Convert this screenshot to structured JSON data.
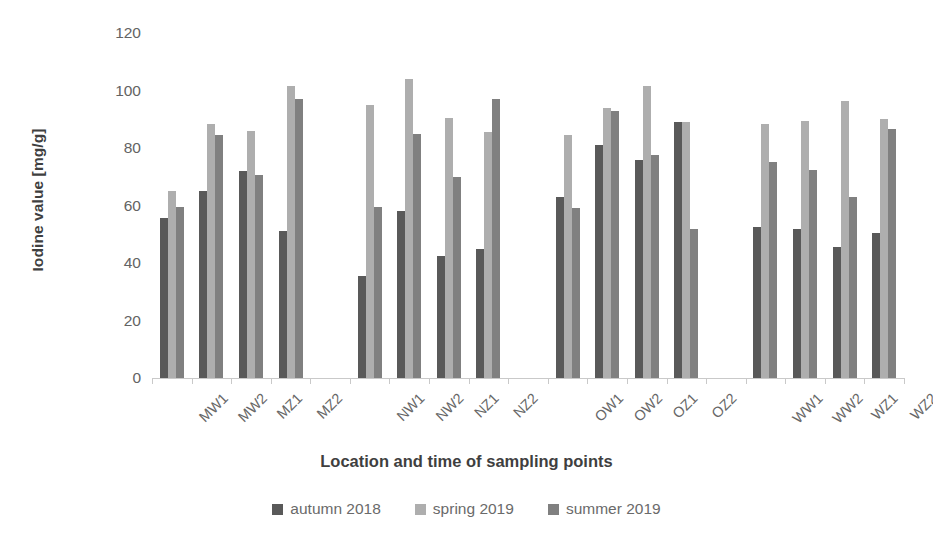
{
  "chart_data": {
    "type": "bar",
    "title": "",
    "xlabel": "Location and time of sampling points",
    "ylabel": "Iodine value [mg/g]",
    "ylim": [
      0,
      120
    ],
    "yticks": [
      0,
      20,
      40,
      60,
      80,
      100,
      120
    ],
    "grid": false,
    "legend_position": "bottom",
    "categories": [
      "MW1",
      "MW2",
      "MZ1",
      "MZ2",
      "NW1",
      "NW2",
      "NZ1",
      "NZ2",
      "OW1",
      "OW2",
      "OZ1",
      "OZ2",
      "WW1",
      "WW2",
      "WZ1",
      "WZ2"
    ],
    "group_breaks_after": [
      "MZ2",
      "NZ2",
      "OZ2"
    ],
    "series": [
      {
        "name": "autumn 2018",
        "color": "#595959",
        "values": [
          55.5,
          65.0,
          72.0,
          51.0,
          35.5,
          58.0,
          42.5,
          45.0,
          63.0,
          81.0,
          76.0,
          89.0,
          52.5,
          52.0,
          45.5,
          50.5
        ]
      },
      {
        "name": "spring 2019",
        "color": "#aeaeae",
        "values": [
          65.0,
          88.5,
          86.0,
          101.5,
          95.0,
          104.0,
          90.5,
          85.5,
          84.5,
          94.0,
          101.5,
          89.0,
          88.5,
          89.5,
          96.5,
          90.0
        ]
      },
      {
        "name": "summer 2019",
        "color": "#808080",
        "values": [
          59.5,
          84.5,
          70.5,
          97.0,
          59.5,
          85.0,
          70.0,
          97.0,
          59.0,
          93.0,
          77.5,
          52.0,
          75.0,
          72.5,
          63.0,
          86.5
        ]
      }
    ]
  },
  "axes": {
    "ytick_labels": [
      "120",
      "100",
      "80",
      "60",
      "40",
      "20",
      "0"
    ],
    "xtitle": "Location and time of sampling points",
    "ytitle": "Iodine value [mg/g]"
  },
  "legend": {
    "items": [
      {
        "label": "autumn 2018",
        "color": "#595959"
      },
      {
        "label": "spring 2019",
        "color": "#aeaeae"
      },
      {
        "label": "summer 2019",
        "color": "#808080"
      }
    ]
  }
}
